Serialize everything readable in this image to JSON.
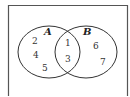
{
  "diagram": {
    "type": "venn",
    "universe_frame": {
      "stroke": "#555555"
    },
    "sets": [
      {
        "label": "A",
        "cx": 49,
        "cy": 52,
        "rx": 31,
        "ry": 26,
        "label_x": 47,
        "label_y": 35
      },
      {
        "label": "B",
        "cx": 86,
        "cy": 52,
        "rx": 31,
        "ry": 26,
        "label_x": 87,
        "label_y": 35
      }
    ],
    "regions": {
      "A_only": [
        "2",
        "4",
        "5"
      ],
      "A_and_B": [
        "1",
        "3"
      ],
      "B_only": [
        "6",
        "7"
      ]
    },
    "elements": [
      {
        "value": "2",
        "x": 35,
        "y": 44
      },
      {
        "value": "4",
        "x": 36,
        "y": 58
      },
      {
        "value": "5",
        "x": 45,
        "y": 71
      },
      {
        "value": "1",
        "x": 68,
        "y": 46
      },
      {
        "value": "3",
        "x": 68,
        "y": 62
      },
      {
        "value": "6",
        "x": 96,
        "y": 49
      },
      {
        "value": "7",
        "x": 103,
        "y": 65
      }
    ]
  }
}
